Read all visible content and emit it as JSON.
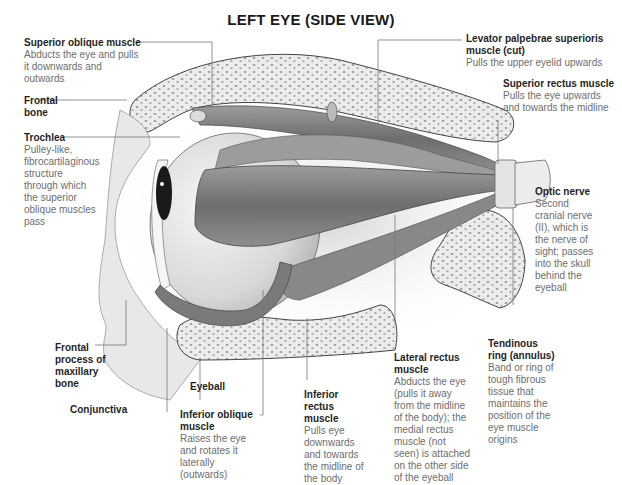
{
  "title": "LEFT EYE (SIDE VIEW)",
  "labels": {
    "superior_oblique": {
      "heading": "Superior oblique muscle",
      "description": "Abducts the eye and pulls it downwards and outwards"
    },
    "levator": {
      "heading": "Levator palpebrae superioris muscle (cut)",
      "description": "Pulls the upper eyelid upwards"
    },
    "superior_rectus": {
      "heading": "Superior rectus muscle",
      "description": "Pulls the eye upwards and towards the midline"
    },
    "frontal_bone": {
      "heading": "Frontal bone",
      "description": ""
    },
    "trochlea": {
      "heading": "Trochlea",
      "description": "Pulley-like, fibrocartilaginous structure through which the superior oblique muscles pass"
    },
    "optic_nerve": {
      "heading": "Optic nerve",
      "description": "Second cranial nerve (II), which is the nerve of sight; passes into the skull behind the eyeball"
    },
    "frontal_process": {
      "heading": "Frontal process of maxillary bone",
      "description": ""
    },
    "tendinous_ring": {
      "heading": "Tendinous ring (annulus)",
      "description": "Band or ring of tough fibrous tissue that maintains the position of the eye muscle origins"
    },
    "eyeball": {
      "heading": "Eyeball",
      "description": ""
    },
    "conjunctiva": {
      "heading": "Conjunctiva",
      "description": ""
    },
    "inferior_oblique": {
      "heading": "Inferior oblique muscle",
      "description": "Raises the eye and rotates it laterally (outwards)"
    },
    "inferior_rectus": {
      "heading": "Inferior rectus muscle",
      "description": "Pulls eye downwards and towards the midline of the body"
    },
    "lateral_rectus": {
      "heading": "Lateral rectus muscle",
      "description": "Abducts the eye (pulls it away from the midline of the body); the medial rectus muscle (not seen) is attached on the other side of the eyeball"
    }
  },
  "colors": {
    "bone": "#ececec",
    "bone_dots": "#9a9a9a",
    "muscle": "#8a8a8a",
    "eyeball": "#e4e4e4",
    "leader": "#777777"
  }
}
